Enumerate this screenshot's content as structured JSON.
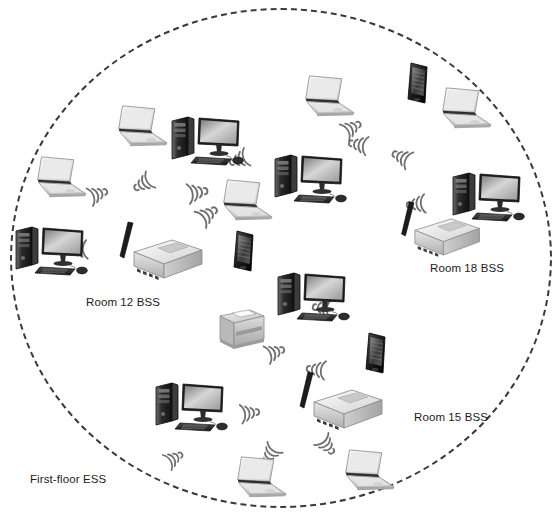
{
  "diagram": {
    "background_color": "#ffffff",
    "boundary": {
      "name": "First-floor ESS",
      "shape": "ellipse",
      "style": "dashed",
      "color": "#3a3a3a"
    },
    "labels": [
      {
        "id": "room12",
        "text": "Room 12 BSS",
        "x": 86,
        "y": 296
      },
      {
        "id": "room18",
        "text": "Room 18 BSS",
        "x": 430,
        "y": 262
      },
      {
        "id": "room15",
        "text": "Room 15 BSS",
        "x": 414,
        "y": 411
      },
      {
        "id": "ess",
        "text": "First-floor ESS",
        "x": 30,
        "y": 473
      }
    ],
    "access_points": [
      {
        "id": "ap-room12",
        "label": "Room 12 BSS access point",
        "x": 112,
        "y": 218,
        "scale": 1.0
      },
      {
        "id": "ap-room18",
        "label": "Room 18 BSS access point",
        "x": 394,
        "y": 198,
        "scale": 0.95
      },
      {
        "id": "ap-room15",
        "label": "Room 15 BSS access point",
        "x": 292,
        "y": 368,
        "scale": 1.0
      }
    ],
    "devices": [
      {
        "id": "laptop-1",
        "type": "laptop",
        "x": 32,
        "y": 155,
        "scale": 0.95
      },
      {
        "id": "laptop-2",
        "type": "laptop",
        "x": 113,
        "y": 104,
        "scale": 0.95
      },
      {
        "id": "desktop-1",
        "type": "desktop",
        "x": 168,
        "y": 112,
        "scale": 1.0
      },
      {
        "id": "laptop-3",
        "type": "laptop",
        "x": 218,
        "y": 178,
        "scale": 0.95
      },
      {
        "id": "desktop-2",
        "type": "desktop",
        "x": 12,
        "y": 222,
        "scale": 1.0
      },
      {
        "id": "laptop-4",
        "type": "laptop",
        "x": 300,
        "y": 74,
        "scale": 0.95
      },
      {
        "id": "phone-1",
        "type": "smartphone",
        "x": 404,
        "y": 62,
        "scale": 1.0
      },
      {
        "id": "laptop-5",
        "type": "laptop",
        "x": 437,
        "y": 86,
        "scale": 0.95
      },
      {
        "id": "desktop-3",
        "type": "desktop",
        "x": 271,
        "y": 150,
        "scale": 1.0
      },
      {
        "id": "desktop-4",
        "type": "desktop",
        "x": 449,
        "y": 168,
        "scale": 1.0
      },
      {
        "id": "phone-2",
        "type": "smartphone",
        "x": 230,
        "y": 230,
        "scale": 1.0
      },
      {
        "id": "desktop-5",
        "type": "desktop",
        "x": 274,
        "y": 268,
        "scale": 1.0
      },
      {
        "id": "printer-1",
        "type": "printer",
        "x": 210,
        "y": 306,
        "scale": 1.0
      },
      {
        "id": "phone-3",
        "type": "smartphone",
        "x": 362,
        "y": 332,
        "scale": 1.0
      },
      {
        "id": "desktop-6",
        "type": "desktop",
        "x": 152,
        "y": 378,
        "scale": 1.0
      },
      {
        "id": "laptop-6",
        "type": "laptop",
        "x": 232,
        "y": 455,
        "scale": 0.95
      },
      {
        "id": "laptop-7",
        "type": "laptop",
        "x": 340,
        "y": 448,
        "scale": 0.95
      }
    ],
    "wave_markers": [
      {
        "id": "wave-1",
        "x": 85,
        "y": 182,
        "rotate": -20,
        "scale": 0.85
      },
      {
        "id": "wave-2",
        "x": 155,
        "y": 160,
        "rotate": 150,
        "scale": 0.85
      },
      {
        "id": "wave-3",
        "x": 183,
        "y": 178,
        "rotate": -10,
        "scale": 0.9
      },
      {
        "id": "wave-4",
        "x": 196,
        "y": 206,
        "rotate": -35,
        "scale": 0.9
      },
      {
        "id": "wave-5",
        "x": 92,
        "y": 232,
        "rotate": 175,
        "scale": 0.85
      },
      {
        "id": "wave-6",
        "x": 172,
        "y": 238,
        "rotate": -8,
        "scale": 0.9
      },
      {
        "id": "wave-7",
        "x": 252,
        "y": 138,
        "rotate": 160,
        "scale": 0.85
      },
      {
        "id": "wave-8",
        "x": 340,
        "y": 118,
        "rotate": -30,
        "scale": 0.85
      },
      {
        "id": "wave-9",
        "x": 372,
        "y": 130,
        "rotate": 190,
        "scale": 0.85
      },
      {
        "id": "wave-10",
        "x": 414,
        "y": 146,
        "rotate": 205,
        "scale": 0.85
      },
      {
        "id": "wave-11",
        "x": 430,
        "y": 186,
        "rotate": 175,
        "scale": 0.85
      },
      {
        "id": "wave-12",
        "x": 336,
        "y": 292,
        "rotate": 185,
        "scale": 0.85
      },
      {
        "id": "wave-13",
        "x": 262,
        "y": 340,
        "rotate": -20,
        "scale": 0.85
      },
      {
        "id": "wave-14",
        "x": 330,
        "y": 354,
        "rotate": 186,
        "scale": 0.85
      },
      {
        "id": "wave-15",
        "x": 236,
        "y": 398,
        "rotate": -8,
        "scale": 0.85
      },
      {
        "id": "wave-16",
        "x": 318,
        "y": 418,
        "rotate": 50,
        "scale": 0.85
      },
      {
        "id": "wave-17",
        "x": 278,
        "y": 426,
        "rotate": 125,
        "scale": 0.85
      },
      {
        "id": "wave-18",
        "x": 163,
        "y": 448,
        "rotate": -30,
        "scale": 0.8
      }
    ]
  }
}
